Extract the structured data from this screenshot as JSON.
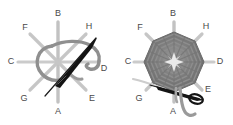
{
  "figure": {
    "background_color": "#ffffff",
    "panel_count": 2,
    "spoke_labels": [
      "A",
      "B",
      "C",
      "D",
      "E",
      "F",
      "G",
      "H"
    ],
    "colors": {
      "spoke": "#bdbdbd",
      "spoke_dark": "#a8a8a8",
      "thread": "#999999",
      "needle": "#1a1a1a",
      "weave_dark": "#6e6e6e",
      "weave_mid": "#8a8a8a",
      "weave_light": "#b5b5b5",
      "center_star": "#e8e8e8",
      "label_text": "#4a4a4a"
    },
    "panels": [
      {
        "id": "left",
        "name": "start-of-weaving",
        "center": {
          "x": 58,
          "y": 62
        },
        "spoke_radius": 40,
        "labels": [
          {
            "key": "A",
            "text": "A",
            "x": 58,
            "y": 112,
            "angle_deg": 90
          },
          {
            "key": "B",
            "text": "B",
            "x": 58,
            "y": 14,
            "angle_deg": 270
          },
          {
            "key": "C",
            "text": "C",
            "x": 11,
            "y": 62,
            "angle_deg": 180
          },
          {
            "key": "D",
            "text": "D",
            "x": 104,
            "y": 69,
            "angle_deg": 0
          },
          {
            "key": "E",
            "text": "E",
            "x": 92,
            "y": 99,
            "angle_deg": 45
          },
          {
            "key": "F",
            "text": "F",
            "x": 25,
            "y": 28,
            "angle_deg": 225
          },
          {
            "key": "G",
            "text": "G",
            "x": 24,
            "y": 99,
            "angle_deg": 135
          },
          {
            "key": "H",
            "text": "H",
            "x": 89,
            "y": 27,
            "angle_deg": 315
          }
        ],
        "elements": [
          "eight-spoke-frame",
          "thread-loop",
          "needle",
          "thread-tail"
        ]
      },
      {
        "id": "right",
        "name": "completed-weave",
        "center": {
          "x": 174,
          "y": 62
        },
        "spoke_radius": 40,
        "weave_radius": 30,
        "weave_ring_count": 7,
        "labels": [
          {
            "key": "A",
            "text": "A",
            "x": 173,
            "y": 112,
            "angle_deg": 90
          },
          {
            "key": "B",
            "text": "B",
            "x": 173,
            "y": 14,
            "angle_deg": 270
          },
          {
            "key": "C",
            "text": "C",
            "x": 128,
            "y": 62,
            "angle_deg": 180
          },
          {
            "key": "D",
            "text": "D",
            "x": 220,
            "y": 62,
            "angle_deg": 0
          },
          {
            "key": "E",
            "text": "E",
            "x": 208,
            "y": 90,
            "angle_deg": 45
          },
          {
            "key": "F",
            "text": "F",
            "x": 140,
            "y": 28,
            "angle_deg": 225
          },
          {
            "key": "G",
            "text": "G",
            "x": 139,
            "y": 99,
            "angle_deg": 135
          },
          {
            "key": "H",
            "text": "H",
            "x": 206,
            "y": 27,
            "angle_deg": 315
          }
        ],
        "elements": [
          "eight-spoke-frame",
          "woven-web",
          "center-star",
          "working-thread",
          "needle",
          "thread-tail-hook"
        ]
      }
    ]
  }
}
